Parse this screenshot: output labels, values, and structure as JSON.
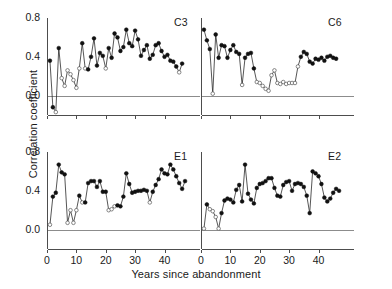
{
  "chart_data": {
    "type": "line",
    "title": "",
    "xlabel": "Years since abandonment",
    "ylabel": "Correlation coefficient",
    "xlim": [
      0,
      48
    ],
    "ylim": [
      -0.2,
      0.8
    ],
    "xticks": [
      0,
      10,
      20,
      30,
      40
    ],
    "yticks": [
      0.0,
      0.4,
      0.8
    ],
    "ytick_labels": [
      "0.0",
      "0.4",
      "0.8"
    ],
    "xtick_labels": [
      "0",
      "10",
      "20",
      "30",
      "40"
    ],
    "grid": false,
    "zero_line": true,
    "legend": null,
    "marker_note": "filled circles = significant, open circles = non-significant",
    "panels": [
      {
        "label": "C3",
        "row": 0,
        "col": 0,
        "x": [
          1,
          2,
          3,
          4,
          5,
          6,
          7,
          8,
          9,
          10,
          11,
          12,
          13,
          14,
          15,
          16,
          17,
          18,
          19,
          20,
          21,
          22,
          23,
          24,
          25,
          26,
          27,
          28,
          29,
          30,
          31,
          32,
          33,
          34,
          35,
          36,
          37,
          38,
          39,
          40,
          41,
          42,
          43,
          44,
          45,
          46
        ],
        "y": [
          0.36,
          -0.12,
          -0.17,
          0.49,
          0.18,
          0.1,
          0.26,
          0.22,
          0.16,
          0.08,
          0.28,
          0.54,
          0.28,
          0.27,
          0.4,
          0.59,
          0.31,
          0.44,
          0.41,
          0.28,
          0.49,
          0.39,
          0.64,
          0.6,
          0.46,
          0.5,
          0.68,
          0.54,
          0.51,
          0.67,
          0.58,
          0.41,
          0.47,
          0.52,
          0.38,
          0.42,
          0.52,
          0.54,
          0.46,
          0.4,
          0.42,
          0.36,
          0.35,
          0.3,
          0.24,
          0.33
        ],
        "filled": [
          1,
          1,
          0,
          1,
          0,
          0,
          0,
          0,
          0,
          0,
          0,
          1,
          0,
          1,
          1,
          1,
          1,
          1,
          1,
          0,
          1,
          1,
          1,
          1,
          1,
          1,
          1,
          1,
          1,
          1,
          1,
          1,
          1,
          1,
          1,
          1,
          1,
          1,
          1,
          1,
          1,
          1,
          1,
          1,
          0,
          1
        ]
      },
      {
        "label": "C6",
        "row": 0,
        "col": 1,
        "x": [
          1,
          2,
          3,
          4,
          5,
          6,
          7,
          8,
          9,
          10,
          11,
          12,
          13,
          14,
          15,
          16,
          17,
          18,
          19,
          20,
          21,
          22,
          23,
          24,
          25,
          26,
          27,
          28,
          29,
          30,
          31,
          32,
          33,
          34,
          35,
          36,
          37,
          38,
          39,
          40,
          41,
          42,
          43,
          44,
          45,
          46
        ],
        "y": [
          0.68,
          0.57,
          0.48,
          0.02,
          0.63,
          0.39,
          0.52,
          0.51,
          0.39,
          0.47,
          0.52,
          0.45,
          0.43,
          0.11,
          0.39,
          0.43,
          0.44,
          0.28,
          0.14,
          0.13,
          0.1,
          0.07,
          0.05,
          0.21,
          0.26,
          0.13,
          0.12,
          0.14,
          0.12,
          0.13,
          0.13,
          0.13,
          0.3,
          0.4,
          0.45,
          0.43,
          0.35,
          0.33,
          0.38,
          0.37,
          0.39,
          0.36,
          0.4,
          0.41,
          0.39,
          0.38
        ],
        "filled": [
          1,
          1,
          1,
          0,
          1,
          1,
          1,
          1,
          1,
          1,
          1,
          1,
          1,
          0,
          1,
          1,
          1,
          1,
          0,
          0,
          0,
          0,
          0,
          0,
          0,
          0,
          0,
          0,
          0,
          0,
          0,
          0,
          0,
          1,
          1,
          1,
          1,
          1,
          1,
          1,
          1,
          1,
          1,
          1,
          1,
          1
        ]
      },
      {
        "label": "E1",
        "row": 1,
        "col": 0,
        "x": [
          1,
          2,
          3,
          4,
          5,
          6,
          7,
          8,
          9,
          10,
          11,
          12,
          13,
          14,
          15,
          16,
          17,
          18,
          19,
          20,
          21,
          22,
          23,
          24,
          25,
          26,
          27,
          28,
          29,
          30,
          31,
          32,
          33,
          34,
          35,
          36,
          37,
          38,
          39,
          40,
          41,
          42,
          43,
          44,
          45,
          46,
          47
        ],
        "y": [
          0.05,
          0.34,
          0.38,
          0.67,
          0.59,
          0.57,
          0.07,
          0.2,
          0.07,
          0.2,
          0.35,
          0.28,
          0.28,
          0.48,
          0.5,
          0.5,
          0.44,
          0.5,
          0.39,
          0.39,
          0.2,
          0.21,
          0.24,
          0.25,
          0.24,
          0.34,
          0.58,
          0.47,
          0.38,
          0.39,
          0.4,
          0.4,
          0.41,
          0.4,
          0.28,
          0.39,
          0.46,
          0.52,
          0.62,
          0.58,
          0.57,
          0.67,
          0.62,
          0.55,
          0.48,
          0.42,
          0.5
        ],
        "filled": [
          0,
          1,
          1,
          1,
          1,
          1,
          0,
          0,
          0,
          0,
          1,
          0,
          1,
          1,
          1,
          1,
          1,
          1,
          1,
          1,
          0,
          0,
          0,
          1,
          1,
          1,
          1,
          1,
          1,
          1,
          1,
          1,
          1,
          1,
          0,
          1,
          1,
          1,
          1,
          1,
          1,
          1,
          1,
          1,
          1,
          1,
          1
        ]
      },
      {
        "label": "E2",
        "row": 1,
        "col": 1,
        "x": [
          1,
          2,
          3,
          4,
          5,
          6,
          7,
          8,
          9,
          10,
          11,
          12,
          13,
          14,
          15,
          16,
          17,
          18,
          19,
          20,
          21,
          22,
          23,
          24,
          25,
          26,
          27,
          28,
          29,
          30,
          31,
          32,
          33,
          34,
          35,
          36,
          37,
          38,
          39,
          40,
          41,
          42,
          43,
          44,
          45,
          46,
          47
        ],
        "y": [
          0.01,
          0.26,
          0.21,
          0.19,
          0.13,
          0.01,
          0.17,
          0.3,
          0.32,
          0.31,
          0.28,
          0.41,
          0.46,
          0.29,
          0.67,
          0.37,
          0.31,
          0.27,
          0.43,
          0.47,
          0.48,
          0.5,
          0.53,
          0.53,
          0.43,
          0.35,
          0.34,
          0.46,
          0.49,
          0.5,
          0.4,
          0.47,
          0.48,
          0.47,
          0.44,
          0.35,
          0.17,
          0.6,
          0.58,
          0.55,
          0.47,
          0.33,
          0.29,
          0.32,
          0.38,
          0.42,
          0.4
        ],
        "filled": [
          0,
          1,
          0,
          0,
          0,
          0,
          1,
          1,
          1,
          1,
          1,
          1,
          1,
          1,
          1,
          1,
          1,
          1,
          1,
          1,
          1,
          1,
          1,
          1,
          1,
          1,
          1,
          1,
          1,
          1,
          1,
          1,
          1,
          1,
          1,
          1,
          1,
          1,
          1,
          1,
          1,
          1,
          1,
          1,
          1,
          1,
          1
        ]
      }
    ]
  },
  "colors": {
    "line": "#2b2b2b",
    "marker_fill": "#111111",
    "marker_open": "#ffffff",
    "axis": "#4d4d4d",
    "text": "#1a1a1a"
  }
}
